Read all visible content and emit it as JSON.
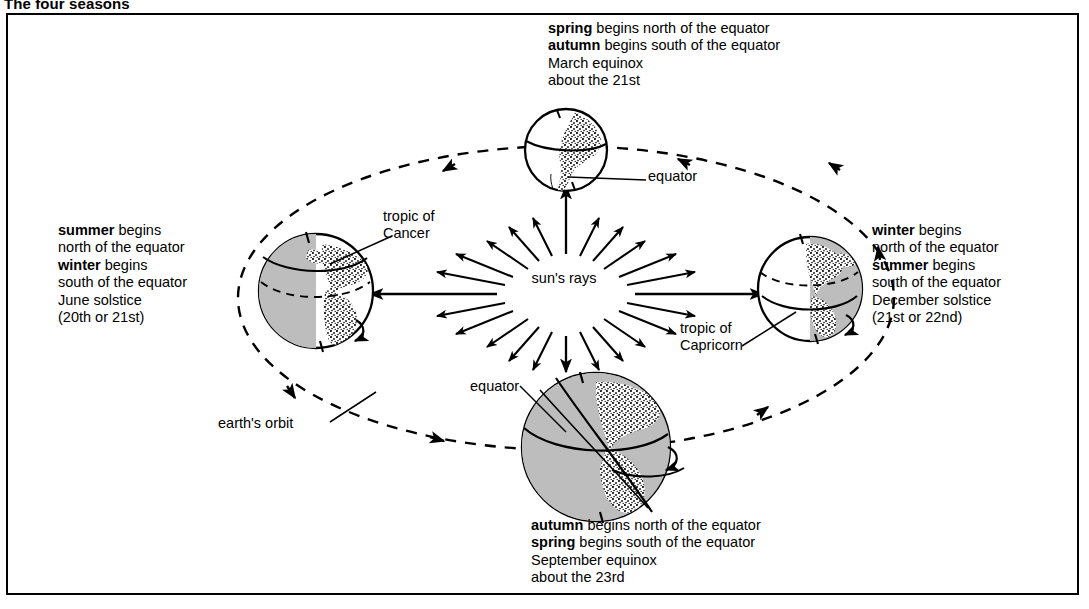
{
  "page": {
    "title": "The four seasons"
  },
  "diagram": {
    "type": "earth-seasons-orbit",
    "center_label": "sun's rays",
    "orbit_label": "earth's orbit",
    "annotations": {
      "equator_top": "equator",
      "equator_bottom": "equator",
      "tropic_of_cancer": "tropic of\nCancer",
      "tropic_of_cancer_line1": "tropic of",
      "tropic_of_cancer_line2": "Cancer",
      "tropic_of_capricorn_line1": "tropic of",
      "tropic_of_capricorn_line2": "Capricorn"
    },
    "positions": {
      "top": {
        "name": "march-equinox",
        "lines": [
          {
            "bold": "spring",
            "rest": " begins north of the equator"
          },
          {
            "bold": "autumn",
            "rest": " begins south of the equator"
          },
          {
            "bold": "",
            "rest": "March equinox"
          },
          {
            "bold": "",
            "rest": "about the 21st"
          }
        ],
        "line1_bold": "spring",
        "line1_rest": " begins north of the equator",
        "line2_bold": "autumn",
        "line2_rest": " begins south of the equator",
        "line3": "March equinox",
        "line4": "about the 21st"
      },
      "left": {
        "name": "june-solstice",
        "line1_bold": "summer",
        "line1_rest": " begins",
        "line2": "north of the equator",
        "line3_bold": "winter",
        "line3_rest": " begins",
        "line4": "south of the equator",
        "line5": "June solstice",
        "line6": "(20th or 21st)"
      },
      "right": {
        "name": "december-solstice",
        "line1_bold": "winter",
        "line1_rest": " begins",
        "line2": "north of the equator",
        "line3_bold": "summer",
        "line3_rest": " begins",
        "line4": "south of the equator",
        "line5": "December solstice",
        "line6": "(21st or 22nd)"
      },
      "bottom": {
        "name": "september-equinox",
        "line1_bold": "autumn",
        "line1_rest": " begins north of the equator",
        "line2_bold": "spring",
        "line2_rest": " begins south of the equator",
        "line3": "September equinox",
        "line4": "about the 23rd"
      }
    },
    "colors": {
      "ink": "#000000",
      "shadow": "#b8b8b8",
      "shadow_dark": "#a9a9a9",
      "page": "#ffffff"
    }
  }
}
